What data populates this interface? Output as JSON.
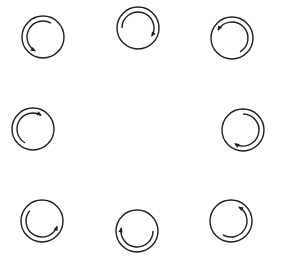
{
  "diagram": {
    "stroke_color": "#1e1e1e",
    "background": "#ffffff",
    "outer_radius": 21,
    "inner_radius": 16,
    "icons": [
      {
        "name": "rotation-icon-top-left",
        "cx": 43,
        "cy": 37,
        "start_deg": -60,
        "end_deg": 120,
        "direction": "counterclockwise"
      },
      {
        "name": "rotation-icon-top-center",
        "cx": 138,
        "cy": 28,
        "start_deg": 180,
        "end_deg": 30,
        "direction": "clockwise"
      },
      {
        "name": "rotation-icon-top-right",
        "cx": 232,
        "cy": 38,
        "start_deg": 60,
        "end_deg": 210,
        "direction": "counterclockwise"
      },
      {
        "name": "rotation-icon-middle-left",
        "cx": 33,
        "cy": 129,
        "start_deg": 120,
        "end_deg": -60,
        "direction": "clockwise"
      },
      {
        "name": "rotation-icon-middle-right",
        "cx": 243,
        "cy": 130,
        "start_deg": -90,
        "end_deg": 120,
        "direction": "clockwise"
      },
      {
        "name": "rotation-icon-bottom-left",
        "cx": 42,
        "cy": 221,
        "start_deg": 220,
        "end_deg": 20,
        "direction": "counterclockwise"
      },
      {
        "name": "rotation-icon-bottom-center",
        "cx": 137,
        "cy": 231,
        "start_deg": 0,
        "end_deg": 190,
        "direction": "clockwise"
      },
      {
        "name": "rotation-icon-bottom-right",
        "cx": 231,
        "cy": 221,
        "start_deg": 120,
        "end_deg": -60,
        "direction": "counterclockwise"
      }
    ]
  }
}
